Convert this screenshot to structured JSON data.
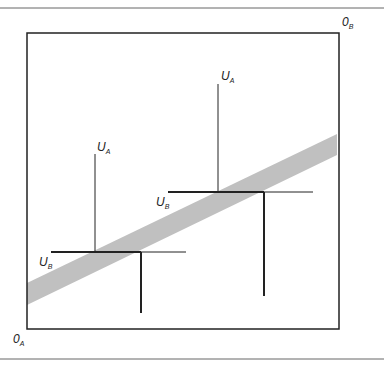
{
  "diagram": {
    "type": "edgeworth-box",
    "origins": {
      "a": {
        "main": "0",
        "sub": "A"
      },
      "b": {
        "main": "0",
        "sub": "B"
      }
    },
    "allocations": [
      {
        "id": "lower",
        "ua": {
          "main": "U",
          "sub": "A"
        },
        "ub": {
          "main": "U",
          "sub": "B"
        }
      },
      {
        "id": "upper",
        "ua": {
          "main": "U",
          "sub": "A"
        },
        "ub": {
          "main": "U",
          "sub": "B"
        }
      }
    ],
    "colors": {
      "frame": "#555555",
      "box": "#222222",
      "lines": "#222222",
      "contract_band": "#c0c0c0",
      "background": "#ffffff"
    }
  }
}
